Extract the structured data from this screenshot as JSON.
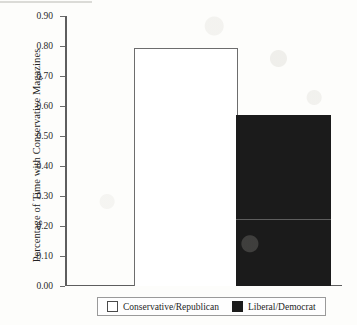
{
  "chart_data": {
    "type": "bar",
    "title": "",
    "xlabel": "",
    "ylabel": "Percentage of Time with Conservative Magazines",
    "categories": [
      "Conservative/Republican",
      "Liberal/Democrat"
    ],
    "values": [
      0.79,
      0.57
    ],
    "ylim": [
      0.0,
      0.9
    ],
    "ytick_labels": [
      "0.90",
      "0.80",
      "0.70",
      "0.60",
      "0.50",
      "0.40",
      "0.30",
      "0.20",
      "0.10",
      "0.00"
    ],
    "ytick_values": [
      0.9,
      0.8,
      0.7,
      0.6,
      0.5,
      0.4,
      0.3,
      0.2,
      0.1,
      0.0
    ],
    "grid": false,
    "legend_position": "bottom",
    "series": [
      {
        "name": "Conservative/Republican",
        "value": 0.79,
        "style": "open",
        "color": "#ffffff",
        "edge_color": "#6d6d6d"
      },
      {
        "name": "Liberal/Democrat",
        "value": 0.57,
        "style": "filled",
        "color": "#1b1b1b",
        "edge_color": "#1b1b1b"
      }
    ]
  },
  "legend": {
    "entries": [
      {
        "label": "Conservative/Republican",
        "style": "open"
      },
      {
        "label": "Liberal/Democrat",
        "style": "filled"
      }
    ]
  }
}
